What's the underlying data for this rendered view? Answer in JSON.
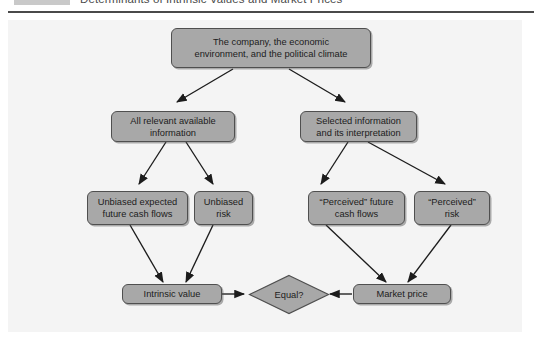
{
  "header": {
    "title": "Determinants of Intrinsic Values and Market Prices",
    "tab_label": ""
  },
  "figure": {
    "background_color": "#f4f4f4",
    "node_fill_color": "#a8a8a8",
    "node_border_color": "#4f4f4f",
    "edge_color": "#1c1c1c",
    "nodes": [
      {
        "id": "source",
        "label": "The company, the economic environment, and the political climate",
        "line1": "The company, the economic",
        "line2": "environment, and the political climate"
      },
      {
        "id": "all-info",
        "label": "All relevant available information",
        "line1": "All relevant available",
        "line2": "information"
      },
      {
        "id": "selected-info",
        "label": "Selected information and its interpretation",
        "line1": "Selected information",
        "line2": "and its interpretation"
      },
      {
        "id": "unbiased-cf",
        "label": "Unbiased expected future cash flows",
        "line1": "Unbiased expected",
        "line2": "future cash flows"
      },
      {
        "id": "unbiased-risk",
        "label": "Unbiased risk",
        "line1": "Unbiased",
        "line2": "risk"
      },
      {
        "id": "perceived-cf",
        "label": "“Perceived” future cash flows",
        "line1": "“Perceived” future",
        "line2": "cash flows"
      },
      {
        "id": "perceived-risk",
        "label": "“Perceived” risk",
        "line1": "“Perceived”",
        "line2": "risk"
      },
      {
        "id": "intrinsic-value",
        "label": "Intrinsic value",
        "line1": "Intrinsic value",
        "line2": ""
      },
      {
        "id": "market-price",
        "label": "Market price",
        "line1": "Market price",
        "line2": ""
      },
      {
        "id": "equal",
        "label": "Equal?",
        "line1": "Equal?",
        "line2": ""
      }
    ]
  }
}
